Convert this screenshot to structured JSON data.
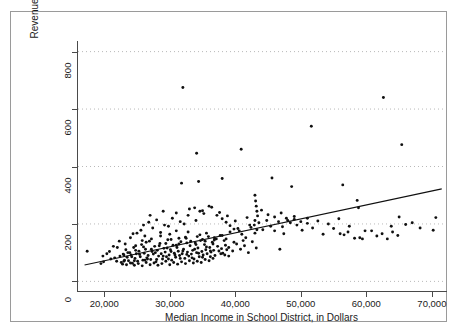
{
  "chart_data": {
    "type": "scatter",
    "title": "",
    "xlabel": "Median Income in School District, in Dollars",
    "ylabel": "Revenue Raised by 1 Mill per Pupil, in Dollars",
    "xlim": [
      16000,
      72000
    ],
    "ylim": [
      -30,
      830
    ],
    "xticks": [
      20000,
      30000,
      40000,
      50000,
      60000,
      70000
    ],
    "xticklabels": [
      "20,000",
      "30,000",
      "40,000",
      "50,000",
      "60,000",
      "70,000"
    ],
    "yticks": [
      0,
      200,
      400,
      600,
      800
    ],
    "yticklabels": [
      "0",
      "200",
      "400",
      "600",
      "800"
    ],
    "grid": true,
    "grid_axis": "y",
    "grid_style": "dotted",
    "legend": "none",
    "marker": "filled-circle",
    "marker_color": "#101010",
    "trendline": {
      "type": "linear",
      "color": "#101010",
      "x_start": 17000,
      "y_start": 57,
      "x_end": 71500,
      "y_end": 322
    },
    "points": [
      [
        17400,
        105
      ],
      [
        19500,
        62
      ],
      [
        19900,
        68
      ],
      [
        21000,
        78
      ],
      [
        21600,
        82
      ],
      [
        21900,
        70
      ],
      [
        22400,
        88
      ],
      [
        22600,
        66
      ],
      [
        22900,
        95
      ],
      [
        23100,
        74
      ],
      [
        23300,
        110
      ],
      [
        23500,
        84
      ],
      [
        23700,
        72
      ],
      [
        23900,
        100
      ],
      [
        24100,
        92
      ],
      [
        24300,
        63
      ],
      [
        24500,
        118
      ],
      [
        24700,
        80
      ],
      [
        24900,
        96
      ],
      [
        25100,
        70
      ],
      [
        25300,
        105
      ],
      [
        25500,
        86
      ],
      [
        25700,
        128
      ],
      [
        25900,
        74
      ],
      [
        26100,
        98
      ],
      [
        26300,
        112
      ],
      [
        26500,
        82
      ],
      [
        26700,
        90
      ],
      [
        26900,
        140
      ],
      [
        27100,
        76
      ],
      [
        27300,
        104
      ],
      [
        27500,
        95
      ],
      [
        27700,
        122
      ],
      [
        27900,
        68
      ],
      [
        28100,
        108
      ],
      [
        28300,
        88
      ],
      [
        28500,
        132
      ],
      [
        28700,
        96
      ],
      [
        28900,
        78
      ],
      [
        29100,
        115
      ],
      [
        29300,
        102
      ],
      [
        29500,
        86
      ],
      [
        29700,
        145
      ],
      [
        29900,
        92
      ],
      [
        30100,
        110
      ],
      [
        30300,
        74
      ],
      [
        30500,
        126
      ],
      [
        30700,
        98
      ],
      [
        30900,
        84
      ],
      [
        31100,
        118
      ],
      [
        31300,
        105
      ],
      [
        31500,
        90
      ],
      [
        31700,
        138
      ],
      [
        31900,
        96
      ],
      [
        32100,
        112
      ],
      [
        32300,
        80
      ],
      [
        32500,
        150
      ],
      [
        32700,
        102
      ],
      [
        32900,
        88
      ],
      [
        33100,
        124
      ],
      [
        33300,
        95
      ],
      [
        33500,
        108
      ],
      [
        33700,
        78
      ],
      [
        33900,
        134
      ],
      [
        34100,
        100
      ],
      [
        34300,
        116
      ],
      [
        34500,
        86
      ],
      [
        34700,
        142
      ],
      [
        34900,
        104
      ],
      [
        35100,
        92
      ],
      [
        35300,
        128
      ],
      [
        35500,
        110
      ],
      [
        35700,
        96
      ],
      [
        35900,
        156
      ],
      [
        36100,
        118
      ],
      [
        36300,
        102
      ],
      [
        36500,
        136
      ],
      [
        36700,
        108
      ],
      [
        36900,
        90
      ],
      [
        37100,
        148
      ],
      [
        37300,
        122
      ],
      [
        37500,
        106
      ],
      [
        37700,
        160
      ],
      [
        37900,
        114
      ],
      [
        38100,
        98
      ],
      [
        38300,
        142
      ],
      [
        38500,
        126
      ],
      [
        38700,
        110
      ],
      [
        23000,
        92
      ],
      [
        23600,
        100
      ],
      [
        24200,
        86
      ],
      [
        24800,
        108
      ],
      [
        25400,
        94
      ],
      [
        26000,
        120
      ],
      [
        26600,
        78
      ],
      [
        27200,
        112
      ],
      [
        27800,
        100
      ],
      [
        28400,
        124
      ],
      [
        29000,
        88
      ],
      [
        29600,
        116
      ],
      [
        30200,
        104
      ],
      [
        30800,
        92
      ],
      [
        31400,
        130
      ],
      [
        32000,
        106
      ],
      [
        32600,
        94
      ],
      [
        33200,
        140
      ],
      [
        33800,
        112
      ],
      [
        34400,
        98
      ],
      [
        35000,
        146
      ],
      [
        35600,
        120
      ],
      [
        36200,
        106
      ],
      [
        36800,
        152
      ],
      [
        22800,
        60
      ],
      [
        23400,
        58
      ],
      [
        24000,
        64
      ],
      [
        24600,
        56
      ],
      [
        25200,
        62
      ],
      [
        25800,
        54
      ],
      [
        26400,
        66
      ],
      [
        27000,
        58
      ],
      [
        27600,
        64
      ],
      [
        28200,
        56
      ],
      [
        28800,
        62
      ],
      [
        29400,
        70
      ],
      [
        30000,
        58
      ],
      [
        30600,
        66
      ],
      [
        31200,
        60
      ],
      [
        31800,
        68
      ],
      [
        32400,
        62
      ],
      [
        33000,
        72
      ],
      [
        33600,
        64
      ],
      [
        34200,
        70
      ],
      [
        34800,
        66
      ],
      [
        35400,
        76
      ],
      [
        36000,
        72
      ],
      [
        36600,
        80
      ],
      [
        24400,
        166
      ],
      [
        25600,
        178
      ],
      [
        26200,
        158
      ],
      [
        27400,
        186
      ],
      [
        28600,
        170
      ],
      [
        29800,
        192
      ],
      [
        31000,
        176
      ],
      [
        32200,
        200
      ],
      [
        26800,
        206
      ],
      [
        28000,
        214
      ],
      [
        29200,
        196
      ],
      [
        30400,
        220
      ],
      [
        31600,
        208
      ],
      [
        32800,
        230
      ],
      [
        34000,
        212
      ],
      [
        35200,
        236
      ],
      [
        27000,
        230
      ],
      [
        29000,
        244
      ],
      [
        31000,
        238
      ],
      [
        33000,
        252
      ],
      [
        35000,
        246
      ],
      [
        36400,
        258
      ],
      [
        37600,
        240
      ],
      [
        38800,
        228
      ],
      [
        33800,
        256
      ],
      [
        34600,
        244
      ],
      [
        36000,
        262
      ],
      [
        37200,
        230
      ],
      [
        38000,
        218
      ],
      [
        38600,
        206
      ],
      [
        39200,
        194
      ],
      [
        39800,
        182
      ],
      [
        38000,
        160
      ],
      [
        38600,
        148
      ],
      [
        39200,
        172
      ],
      [
        39800,
        136
      ],
      [
        40400,
        184
      ],
      [
        41000,
        164
      ],
      [
        41600,
        152
      ],
      [
        42200,
        196
      ],
      [
        40000,
        210
      ],
      [
        40600,
        176
      ],
      [
        41200,
        142
      ],
      [
        41800,
        222
      ],
      [
        42400,
        188
      ],
      [
        43000,
        168
      ],
      [
        43600,
        204
      ],
      [
        44200,
        180
      ],
      [
        39000,
        118
      ],
      [
        39600,
        106
      ],
      [
        40200,
        130
      ],
      [
        40800,
        112
      ],
      [
        41400,
        124
      ],
      [
        42000,
        100
      ],
      [
        42600,
        138
      ],
      [
        43200,
        116
      ],
      [
        43000,
        300
      ],
      [
        43100,
        280
      ],
      [
        43200,
        262
      ],
      [
        43300,
        244
      ],
      [
        43400,
        228
      ],
      [
        43000,
        212
      ],
      [
        42900,
        196
      ],
      [
        43300,
        180
      ],
      [
        44800,
        212
      ],
      [
        45400,
        192
      ],
      [
        46000,
        176
      ],
      [
        46600,
        208
      ],
      [
        47200,
        190
      ],
      [
        47800,
        220
      ],
      [
        48400,
        204
      ],
      [
        49000,
        216
      ],
      [
        44000,
        248
      ],
      [
        45000,
        232
      ],
      [
        46000,
        224
      ],
      [
        47000,
        238
      ],
      [
        48000,
        212
      ],
      [
        49000,
        226
      ],
      [
        50000,
        208
      ],
      [
        51000,
        220
      ],
      [
        45600,
        360
      ],
      [
        46800,
        112
      ],
      [
        47400,
        166
      ],
      [
        48600,
        330
      ],
      [
        49400,
        196
      ],
      [
        50200,
        178
      ],
      [
        51000,
        202
      ],
      [
        51800,
        186
      ],
      [
        52600,
        210
      ],
      [
        53400,
        164
      ],
      [
        54200,
        200
      ],
      [
        55000,
        184
      ],
      [
        55800,
        218
      ],
      [
        56600,
        162
      ],
      [
        57400,
        192
      ],
      [
        58200,
        150
      ],
      [
        59000,
        152
      ],
      [
        59400,
        148
      ],
      [
        59800,
        176
      ],
      [
        58800,
        256
      ],
      [
        58600,
        282
      ],
      [
        56400,
        336
      ],
      [
        51600,
        540
      ],
      [
        62600,
        640
      ],
      [
        65400,
        476
      ],
      [
        63800,
        192
      ],
      [
        65000,
        224
      ],
      [
        66000,
        198
      ],
      [
        68200,
        186
      ],
      [
        70600,
        222
      ],
      [
        70200,
        178
      ],
      [
        67000,
        204
      ],
      [
        60800,
        176
      ],
      [
        61600,
        158
      ],
      [
        62400,
        166
      ],
      [
        63200,
        148
      ],
      [
        64000,
        172
      ],
      [
        64800,
        160
      ],
      [
        56000,
        166
      ],
      [
        57200,
        172
      ],
      [
        32000,
        675
      ],
      [
        34100,
        446
      ],
      [
        40900,
        460
      ],
      [
        38000,
        358
      ],
      [
        34400,
        348
      ],
      [
        31800,
        342
      ],
      [
        22300,
        140
      ],
      [
        21400,
        122
      ],
      [
        20800,
        104
      ],
      [
        23200,
        130
      ],
      [
        26000,
        196
      ],
      [
        24000,
        152
      ],
      [
        25000,
        168
      ],
      [
        22000,
        118
      ],
      [
        20400,
        96
      ],
      [
        19800,
        88
      ],
      [
        37800,
        96
      ],
      [
        38400,
        92
      ],
      [
        39000,
        88
      ],
      [
        36200,
        86
      ],
      [
        35000,
        84
      ],
      [
        33400,
        82
      ],
      [
        31600,
        80
      ],
      [
        29800,
        78
      ],
      [
        28000,
        76
      ],
      [
        26200,
        74
      ],
      [
        24600,
        72
      ],
      [
        23000,
        70
      ],
      [
        30200,
        146
      ],
      [
        32400,
        154
      ],
      [
        34600,
        162
      ],
      [
        36800,
        144
      ],
      [
        28600,
        158
      ],
      [
        30000,
        164
      ],
      [
        31400,
        150
      ],
      [
        32800,
        172
      ],
      [
        34200,
        156
      ],
      [
        35600,
        168
      ],
      [
        27200,
        148
      ],
      [
        25800,
        142
      ],
      [
        29400,
        132
      ],
      [
        31000,
        126
      ],
      [
        32600,
        134
      ],
      [
        34000,
        128
      ],
      [
        35400,
        140
      ],
      [
        36600,
        130
      ],
      [
        26400,
        136
      ],
      [
        24800,
        124
      ]
    ]
  }
}
